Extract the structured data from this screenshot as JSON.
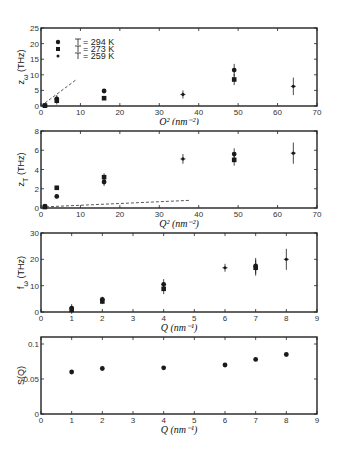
{
  "figure": {
    "colors": {
      "axis": "#222222",
      "marker": "#1a1a1a",
      "dashed": "#444444",
      "background": "#ffffff"
    }
  },
  "chart_data": [
    {
      "type": "scatter",
      "panel": "a",
      "title": "",
      "xlabel": "Q² (nm⁻²)",
      "ylabel": "z_ω (THz)",
      "xlim": [
        0,
        70
      ],
      "ylim": [
        0,
        25
      ],
      "xticks": [
        0,
        10,
        20,
        30,
        40,
        50,
        60,
        70
      ],
      "yticks": [
        0,
        5,
        10,
        15,
        20,
        25
      ],
      "legend": [
        "T = 294 K",
        "T = 273 K",
        "T = 259 K"
      ],
      "legend_position": "upper left",
      "series": [
        {
          "name": "T = 294 K",
          "marker": "circle",
          "points": [
            [
              1,
              0.2,
              0.3
            ],
            [
              4,
              2.3,
              1.2
            ],
            [
              16,
              4.8,
              0.6
            ],
            [
              49,
              11.5,
              2.0
            ]
          ]
        },
        {
          "name": "T = 273 K",
          "marker": "square",
          "points": [
            [
              1,
              0.1,
              0.3
            ],
            [
              4,
              1.7,
              1.2
            ],
            [
              16,
              2.5,
              0.6
            ],
            [
              49,
              8.5,
              1.8
            ]
          ]
        },
        {
          "name": "T = 259 K",
          "marker": "small-dot",
          "points": [
            [
              36,
              3.7,
              1.3
            ],
            [
              64,
              6.3,
              2.8
            ]
          ]
        }
      ],
      "dashed_line": [
        [
          0,
          0
        ],
        [
          9,
          8.5
        ]
      ]
    },
    {
      "type": "scatter",
      "panel": "b",
      "title": "",
      "xlabel": "Q² (nm⁻²)",
      "ylabel": "z_T (THz)",
      "xlim": [
        0,
        70
      ],
      "ylim": [
        0,
        8
      ],
      "xticks": [
        0,
        10,
        20,
        30,
        40,
        50,
        60,
        70
      ],
      "yticks": [
        0,
        2,
        4,
        6,
        8
      ],
      "series": [
        {
          "name": "T = 294 K",
          "marker": "circle",
          "points": [
            [
              1,
              0.2,
              0.1
            ],
            [
              4,
              1.2,
              0.2
            ],
            [
              16,
              2.7,
              0.4
            ],
            [
              49,
              5.6,
              0.6
            ]
          ]
        },
        {
          "name": "T = 273 K",
          "marker": "square",
          "points": [
            [
              1,
              0.1,
              0.1
            ],
            [
              4,
              2.1,
              0.2
            ],
            [
              16,
              3.2,
              0.4
            ],
            [
              49,
              5.0,
              0.6
            ]
          ]
        },
        {
          "name": "T = 259 K",
          "marker": "small-dot",
          "points": [
            [
              36,
              5.1,
              0.5
            ],
            [
              64,
              5.7,
              1.1
            ]
          ]
        }
      ],
      "dashed_line": [
        [
          0,
          0.1
        ],
        [
          38,
          0.8
        ]
      ]
    },
    {
      "type": "scatter",
      "panel": "c",
      "title": "",
      "xlabel": "Q (nm⁻¹)",
      "ylabel": "f_ω (THz)",
      "xlim": [
        0,
        9
      ],
      "ylim": [
        0,
        30
      ],
      "xticks": [
        0,
        1,
        2,
        3,
        4,
        5,
        6,
        7,
        8,
        9
      ],
      "yticks": [
        0,
        10,
        20,
        30
      ],
      "series": [
        {
          "name": "T = 294 K",
          "marker": "circle",
          "points": [
            [
              1,
              1.5,
              1.5
            ],
            [
              2,
              4.8,
              1.0
            ],
            [
              4,
              10.5,
              2.0
            ],
            [
              7,
              17.5,
              3.0
            ]
          ]
        },
        {
          "name": "T = 273 K",
          "marker": "square",
          "points": [
            [
              1,
              0.8,
              1.5
            ],
            [
              2,
              4.0,
              1.0
            ],
            [
              4,
              8.8,
              2.0
            ],
            [
              7,
              16.8,
              3.0
            ]
          ]
        },
        {
          "name": "T = 259 K",
          "marker": "small-dot",
          "points": [
            [
              6,
              16.8,
              1.5
            ],
            [
              8,
              20.0,
              4.0
            ]
          ]
        }
      ]
    },
    {
      "type": "scatter",
      "panel": "d",
      "title": "",
      "xlabel": "Q (nm⁻¹)",
      "ylabel": "S(Q)",
      "xlim": [
        0,
        9
      ],
      "ylim": [
        0,
        0.11
      ],
      "xticks": [
        0,
        1,
        2,
        3,
        4,
        5,
        6,
        7,
        8,
        9
      ],
      "yticks": [
        0,
        0.05,
        0.1
      ],
      "ytick_labels": [
        "0",
        "0.05",
        "0.1"
      ],
      "series": [
        {
          "name": "S(Q)",
          "marker": "circle",
          "points": [
            [
              1,
              0.06
            ],
            [
              2,
              0.065
            ],
            [
              4,
              0.066
            ],
            [
              6,
              0.07
            ],
            [
              7,
              0.078
            ],
            [
              8,
              0.085
            ]
          ]
        }
      ]
    }
  ]
}
